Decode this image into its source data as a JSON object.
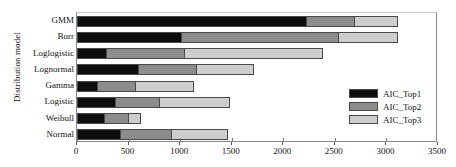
{
  "chart_data": {
    "type": "bar",
    "orientation": "horizontal",
    "stacked": true,
    "title": "",
    "xlabel": "",
    "ylabel": "Distribution model",
    "xlim": [
      0,
      3500
    ],
    "xticks": [
      0,
      500,
      1000,
      1500,
      2000,
      2500,
      3000,
      3500
    ],
    "xtick_labels": [
      "0",
      "500",
      "1000",
      "1500",
      "2000",
      "2500",
      "3000",
      "3500"
    ],
    "grid": false,
    "legend_position": "right-inside",
    "categories": [
      "GMM",
      "Burr",
      "Loglogistic",
      "Lognormal",
      "Gamma",
      "Logistic",
      "Weibull",
      "Normal"
    ],
    "series": [
      {
        "name": "AIC_Top1",
        "color": "#0d0d0d",
        "values": [
          2220,
          1008,
          281,
          591,
          194,
          369,
          262,
          417
        ]
      },
      {
        "name": "AIC_Top2",
        "color": "#8c8c8c",
        "values": [
          466,
          1522,
          756,
          563,
          368,
          426,
          232,
          494
        ]
      },
      {
        "name": "AIC_Top3",
        "color": "#cdcdcd",
        "values": [
          426,
          582,
          1348,
          562,
          572,
          688,
          126,
          553
        ]
      }
    ],
    "totals": [
      3112,
      3112,
      2385,
      1716,
      1134,
      1483,
      620,
      1464
    ]
  },
  "axes": {
    "y_title": "Distribution model"
  },
  "legend": {
    "entries": [
      {
        "label": "AIC_Top1",
        "color": "#0d0d0d"
      },
      {
        "label": "AIC_Top2",
        "color": "#8c8c8c"
      },
      {
        "label": "AIC_Top3",
        "color": "#cdcdcd"
      }
    ]
  }
}
